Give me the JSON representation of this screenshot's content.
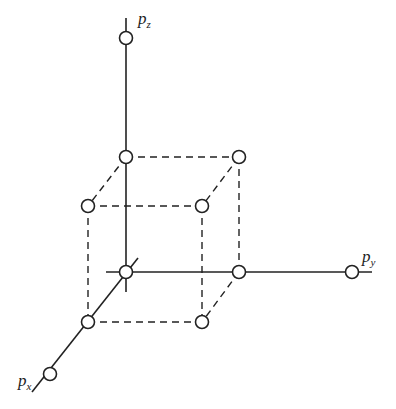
{
  "diagram": {
    "type": "3d-lattice-cube",
    "axes": [
      {
        "id": "pz",
        "label": "p",
        "subscript": "z"
      },
      {
        "id": "py",
        "label": "p",
        "subscript": "y"
      },
      {
        "id": "px",
        "label": "p",
        "subscript": "x"
      }
    ],
    "colors": {
      "line": "#222222",
      "node_fill": "#ffffff",
      "background": "#ffffff"
    }
  }
}
